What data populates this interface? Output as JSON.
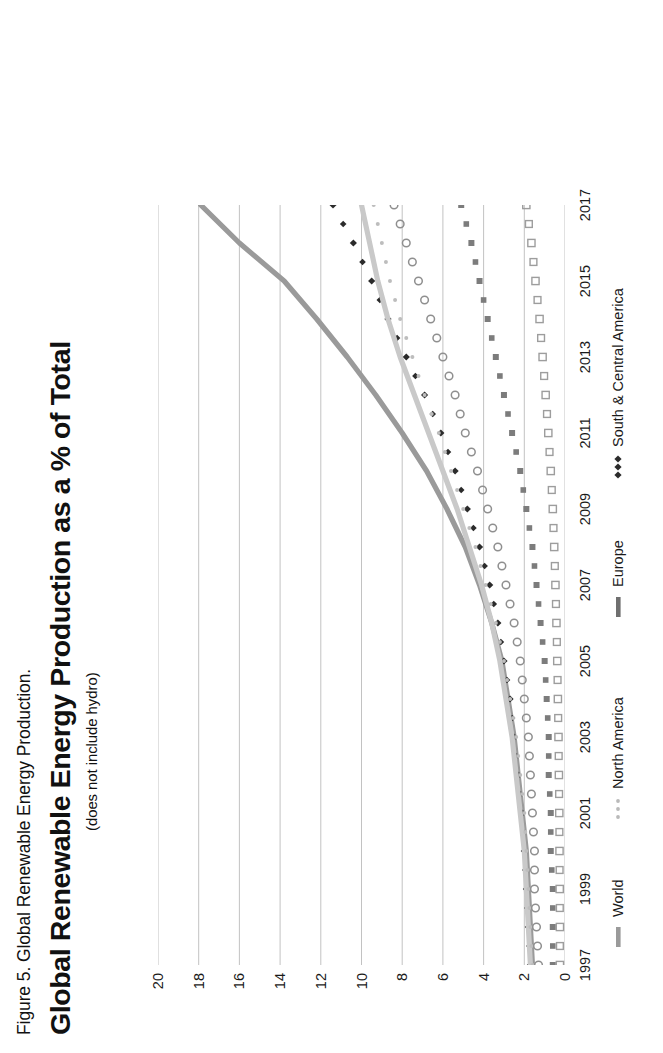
{
  "figure": {
    "caption": "Figure 5. Global Renewable Energy Production.",
    "title": "Global Renewable Energy Production as a % of Total",
    "subtitle": "(does not include hydro)"
  },
  "axes": {
    "y_ticks": [
      "0",
      "2",
      "4",
      "6",
      "8",
      "10",
      "12",
      "14",
      "16",
      "18",
      "20"
    ],
    "x_ticks": [
      "1997",
      "1999",
      "2001",
      "2003",
      "2005",
      "2007",
      "2009",
      "2011",
      "2013",
      "2015",
      "2017"
    ]
  },
  "legend": {
    "items": [
      {
        "label": "World",
        "marker": "thick-line",
        "color": "#9a9a9a"
      },
      {
        "label": "North America",
        "marker": "dotted-round",
        "color": "#b9b9b9"
      },
      {
        "label": "Europe",
        "marker": "thick-line",
        "color": "#6f6f6f"
      },
      {
        "label": "South & Central America",
        "marker": "diamond",
        "color": "#2b2b2b"
      }
    ]
  },
  "chart_data": {
    "type": "line",
    "title": "Global Renewable Energy Production as a % of Total",
    "subtitle": "(does not include hydro)",
    "xlabel": "",
    "ylabel": "% of Total",
    "grid": true,
    "grid_axis": "y",
    "legend_position": "bottom",
    "xlim": [
      1997,
      2017
    ],
    "ylim": [
      0,
      20
    ],
    "x": [
      1997,
      1998,
      1999,
      2000,
      2001,
      2002,
      2003,
      2004,
      2005,
      2006,
      2007,
      2008,
      2009,
      2010,
      2011,
      2012,
      2013,
      2014,
      2015,
      2016,
      2017
    ],
    "series": [
      {
        "name": "World",
        "style": "thick-solid-line",
        "color": "#9a9a9a",
        "values": [
          1.6,
          1.7,
          1.8,
          1.9,
          2.1,
          2.3,
          2.5,
          2.8,
          3.1,
          3.6,
          4.2,
          4.9,
          5.8,
          6.8,
          8.0,
          9.3,
          10.7,
          12.2,
          13.8,
          16.0,
          17.9
        ]
      },
      {
        "name": "South & Central America",
        "style": "filled-diamond-markers",
        "color": "#2b2b2b",
        "values": [
          1.7,
          1.8,
          1.9,
          2.0,
          2.1,
          2.3,
          2.5,
          2.7,
          3.0,
          3.3,
          3.7,
          4.2,
          4.8,
          5.4,
          6.1,
          6.9,
          7.8,
          8.7,
          9.5,
          10.4,
          11.4
        ]
      },
      {
        "name": "Europe",
        "style": "thick-solid-line",
        "color": "#c9c9c9",
        "values": [
          1.7,
          1.8,
          1.9,
          2.0,
          2.2,
          2.4,
          2.6,
          2.9,
          3.2,
          3.6,
          4.1,
          4.7,
          5.3,
          6.0,
          6.7,
          7.4,
          8.1,
          8.7,
          9.2,
          9.6,
          10.0
        ]
      },
      {
        "name": "Europe (dotted companion)",
        "style": "small-dotted-markers",
        "color": "#bdbdbd",
        "values": [
          1.6,
          1.7,
          1.8,
          1.9,
          2.0,
          2.2,
          2.4,
          2.7,
          3.0,
          3.4,
          3.9,
          4.4,
          5.0,
          5.6,
          6.2,
          6.9,
          7.5,
          8.1,
          8.6,
          9.0,
          9.4
        ]
      },
      {
        "name": "North America",
        "style": "open-circle-markers",
        "color": "#8f8f8f",
        "values": [
          1.3,
          1.4,
          1.5,
          1.5,
          1.6,
          1.7,
          1.8,
          2.0,
          2.2,
          2.5,
          2.9,
          3.3,
          3.8,
          4.3,
          4.9,
          5.4,
          6.0,
          6.6,
          7.2,
          7.8,
          8.4
        ]
      },
      {
        "name": "Asia Pacific",
        "style": "filled-square-markers",
        "color": "#7c7c7c",
        "values": [
          0.6,
          0.6,
          0.6,
          0.7,
          0.7,
          0.8,
          0.8,
          0.9,
          1.0,
          1.2,
          1.4,
          1.6,
          1.9,
          2.2,
          2.6,
          3.0,
          3.4,
          3.8,
          4.2,
          4.6,
          5.1
        ]
      },
      {
        "name": "Middle East & Africa",
        "style": "open-square-markers",
        "color": "#9d9d9d",
        "values": [
          0.25,
          0.25,
          0.26,
          0.27,
          0.28,
          0.3,
          0.32,
          0.35,
          0.38,
          0.42,
          0.47,
          0.53,
          0.6,
          0.7,
          0.82,
          0.95,
          1.1,
          1.25,
          1.45,
          1.65,
          1.9
        ]
      }
    ]
  }
}
